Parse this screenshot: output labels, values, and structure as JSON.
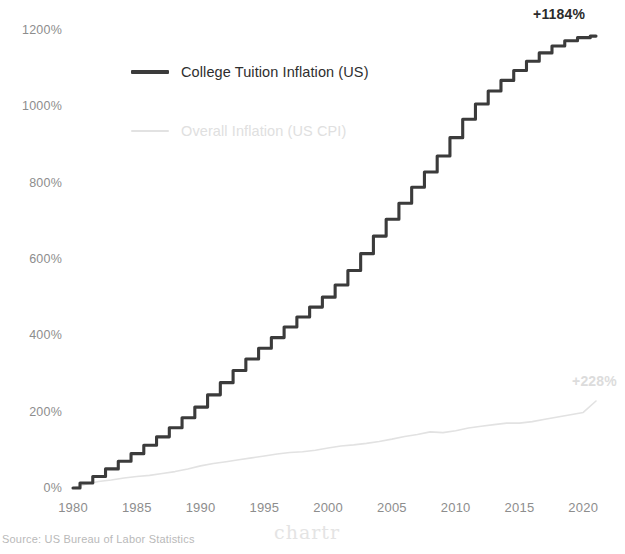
{
  "source_note": "Source: US Bureau of Labor Statistics",
  "watermark": "chartr",
  "colors": {
    "tuition_line": "#3b3b3b",
    "cpi_line": "#e2e2e2",
    "tick_text": "#8d8d8d",
    "background": "#ffffff"
  },
  "legend": {
    "position": "inside-top-left",
    "items": [
      {
        "label": "College Tuition Inflation (US)",
        "color": "#3b3b3b",
        "style": "dark"
      },
      {
        "label": "Overall Inflation (US CPI)",
        "color": "#e2e2e2",
        "style": "light"
      }
    ]
  },
  "annotations": {
    "tuition_end": "+1184%",
    "cpi_end": "+228%"
  },
  "chart_data": {
    "type": "line",
    "title": "",
    "subtitle": "",
    "xlabel": "",
    "ylabel": "",
    "grid": false,
    "legend_position": "inside-top-left",
    "xlim": [
      1980,
      2021
    ],
    "ylim": [
      0,
      1250
    ],
    "xticks": [
      1980,
      1985,
      1990,
      1995,
      2000,
      2005,
      2010,
      2015,
      2020
    ],
    "xtick_labels": [
      "1980",
      "1985",
      "1990",
      "1995",
      "2000",
      "2005",
      "2010",
      "2015",
      "2020"
    ],
    "yticks": [
      0,
      200,
      400,
      600,
      800,
      1000,
      1200
    ],
    "ytick_labels": [
      "0%",
      "200%",
      "400%",
      "600%",
      "800%",
      "1000%",
      "1200%"
    ],
    "x": [
      1980,
      1981,
      1982,
      1983,
      1984,
      1985,
      1986,
      1987,
      1988,
      1989,
      1990,
      1991,
      1992,
      1993,
      1994,
      1995,
      1996,
      1997,
      1998,
      1999,
      2000,
      2001,
      2002,
      2003,
      2004,
      2005,
      2006,
      2007,
      2008,
      2009,
      2010,
      2011,
      2012,
      2013,
      2014,
      2015,
      2016,
      2017,
      2018,
      2019,
      2020,
      2021
    ],
    "series": [
      {
        "name": "College Tuition Inflation (US)",
        "color": "#3b3b3b",
        "shape": "step",
        "end_label": "+1184%",
        "values": [
          0,
          13,
          30,
          50,
          70,
          90,
          112,
          134,
          158,
          184,
          212,
          244,
          276,
          308,
          338,
          366,
          394,
          422,
          448,
          474,
          500,
          532,
          570,
          614,
          660,
          704,
          746,
          788,
          828,
          870,
          918,
          966,
          1006,
          1040,
          1068,
          1094,
          1118,
          1140,
          1158,
          1172,
          1180,
          1184
        ]
      },
      {
        "name": "Overall Inflation (US CPI)",
        "color": "#e2e2e2",
        "shape": "smooth",
        "end_label": "+228%",
        "values": [
          0,
          10,
          17,
          21,
          26,
          30,
          33,
          38,
          43,
          50,
          58,
          64,
          69,
          74,
          79,
          84,
          89,
          93,
          95,
          99,
          105,
          110,
          113,
          117,
          122,
          128,
          135,
          140,
          147,
          145,
          150,
          157,
          162,
          166,
          170,
          170,
          174,
          180,
          186,
          192,
          198,
          228
        ]
      }
    ]
  }
}
